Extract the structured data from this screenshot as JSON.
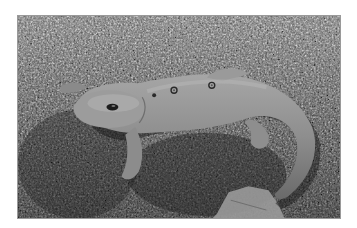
{
  "image": {
    "subject": "salamander",
    "style": "grayscale photograph",
    "colors": {
      "border": "#ffffff",
      "ground_dark": "#2e2e2e",
      "ground_light": "#bdbdbd",
      "body": "#8f8f8f",
      "body_highlight": "#b0b0b0",
      "spot": "#2a2a2a"
    }
  }
}
